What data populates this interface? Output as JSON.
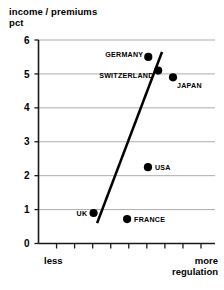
{
  "chart_data": {
    "type": "scatter",
    "title": "income / premiums pct",
    "title_lines": [
      "income / premiums",
      "pct"
    ],
    "xlabel": "regulation",
    "ylabel": "income / premiums pct",
    "xlim": [
      0,
      1
    ],
    "ylim": [
      0,
      6
    ],
    "grid": true,
    "legend": "none",
    "y_ticks": [
      0,
      1,
      2,
      3,
      4,
      5,
      6
    ],
    "y_tick_labels": [
      "0",
      "1",
      "2",
      "3",
      "4",
      "5",
      "6"
    ],
    "x_axis_type": "ordinal",
    "x_tick_count": 9,
    "x_tick_labels": [
      "",
      "",
      "",
      "",
      "",
      "",
      "",
      "",
      ""
    ],
    "x_axis_low_label": "less",
    "x_axis_high_label_lines": [
      "more",
      "regulation"
    ],
    "points": [
      {
        "label": "GERMANY",
        "x": 0.622,
        "y": 5.5,
        "label_pos": "above-left"
      },
      {
        "label": "SWITZERLAND",
        "x": 0.678,
        "y": 5.1,
        "label_pos": "below-left"
      },
      {
        "label": "JAPAN",
        "x": 0.762,
        "y": 4.9,
        "label_pos": "below-right"
      },
      {
        "label": "USA",
        "x": 0.62,
        "y": 2.25,
        "label_pos": "right"
      },
      {
        "label": "UK",
        "x": 0.312,
        "y": 0.9,
        "label_pos": "left"
      },
      {
        "label": "FRANCE",
        "x": 0.502,
        "y": 0.72,
        "label_pos": "right"
      }
    ],
    "trend_line": {
      "x_start": 0.332,
      "y_start": 0.6,
      "x_end": 0.7,
      "y_end": 5.65
    },
    "colors": {
      "point": "#000000",
      "trend": "#000000",
      "grid": "#8a8a8a",
      "axis": "#1a1a1a",
      "background": "#ffffff"
    }
  },
  "y_axis": {
    "ticks": [
      {
        "value": "6"
      },
      {
        "value": "5"
      },
      {
        "value": "4"
      },
      {
        "value": "3"
      },
      {
        "value": "2"
      },
      {
        "value": "1"
      },
      {
        "value": "0"
      }
    ]
  },
  "point_labels": {
    "germany": "GERMANY",
    "switzerland": "SWITZERLAND",
    "japan": "JAPAN",
    "usa": "USA",
    "uk": "UK",
    "france": "FRANCE"
  },
  "captions": {
    "title_line1": "income / premiums",
    "title_line2": "pct",
    "less": "less",
    "more": "more",
    "regulation": "regulation"
  }
}
